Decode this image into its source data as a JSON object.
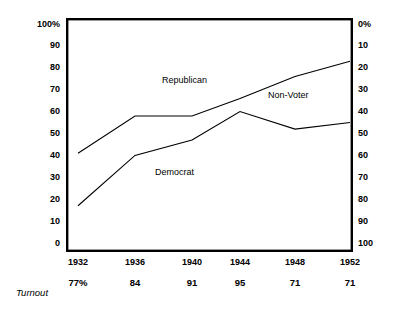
{
  "chart_data": {
    "type": "line",
    "title": "",
    "subtitle": "",
    "xlabel": "",
    "ylabel": "",
    "x": [
      "1932",
      "1936",
      "1940",
      "1944",
      "1948",
      "1952"
    ],
    "categories": [
      "1932",
      "1936",
      "1940",
      "1944",
      "1948",
      "1952"
    ],
    "series": [
      {
        "name": "Non-Voter",
        "values": [
          41,
          58,
          58,
          66,
          76,
          83
        ],
        "note": "upper cumulative boundary line"
      },
      {
        "name": "Democrat",
        "values": [
          17,
          40,
          47,
          60,
          52,
          55
        ],
        "note": "lower cumulative boundary line"
      }
    ],
    "bands": [
      {
        "name": "Republican",
        "position": "above upper line"
      },
      {
        "name": "Non-Voter",
        "position": "between the two lines"
      },
      {
        "name": "Democrat",
        "position": "below lower line"
      }
    ],
    "left_axis": {
      "ticks": [
        "100%",
        "90",
        "80",
        "70",
        "60",
        "50",
        "40",
        "30",
        "20",
        "10",
        "0"
      ],
      "range": [
        0,
        100
      ],
      "direction": "ascending-upward"
    },
    "right_axis": {
      "ticks": [
        "0%",
        "10",
        "20",
        "30",
        "40",
        "50",
        "60",
        "70",
        "80",
        "90",
        "100"
      ],
      "range": [
        0,
        100
      ],
      "direction": "descending-upward"
    },
    "grid": false,
    "legend": "inline-annotations",
    "annotations": [
      {
        "label": "Republican",
        "x_px": 162,
        "y_px": 76
      },
      {
        "label": "Non-Voter",
        "x_px": 268,
        "y_px": 91
      },
      {
        "label": "Democrat",
        "x_px": 155,
        "y_px": 168
      }
    ],
    "turnout_row": {
      "label": "Turnout",
      "values": [
        "77%",
        "84",
        "91",
        "95",
        "71",
        "71"
      ]
    },
    "colors": {
      "frame": "#000000",
      "line": "#000000",
      "text": "#000000",
      "background": "#ffffff"
    }
  },
  "left_axis_labels": [
    "100%",
    "90",
    "80",
    "70",
    "60",
    "50",
    "40",
    "30",
    "20",
    "10",
    "0"
  ],
  "right_axis_labels": [
    "0%",
    "10",
    "20",
    "30",
    "40",
    "50",
    "60",
    "70",
    "80",
    "90",
    "100"
  ],
  "series_labels": {
    "republican": "Republican",
    "non_voter": "Non-Voter",
    "democrat": "Democrat"
  },
  "bottom": {
    "turnout_label": "Turnout",
    "columns": [
      {
        "year": "1932",
        "turnout": "77%"
      },
      {
        "year": "1936",
        "turnout": "84"
      },
      {
        "year": "1940",
        "turnout": "91"
      },
      {
        "year": "1944",
        "turnout": "95"
      },
      {
        "year": "1948",
        "turnout": "71"
      },
      {
        "year": "1952",
        "turnout": "71"
      }
    ]
  }
}
